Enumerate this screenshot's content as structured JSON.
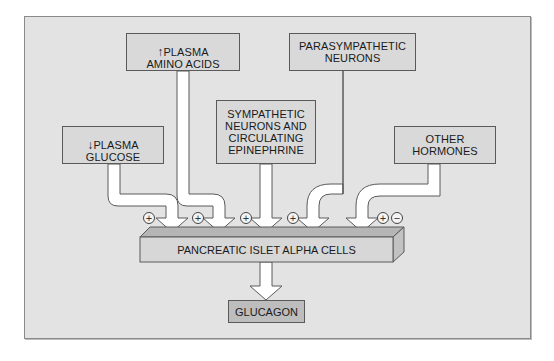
{
  "diagram": {
    "colors": {
      "frame_fill": "#e3e3e3",
      "box_fill": "#d9d9d9",
      "glucagon_fill": "#bdbdbd",
      "bar_top": "#b5b5b5",
      "bar_front": "#d7d7d7",
      "bar_side": "#c2c2c2",
      "arrow_fill": "#ffffff",
      "outline": "#5a5a5a"
    },
    "inputs": [
      {
        "id": "plasma-glucose",
        "arrow": "↓",
        "label": "PLASMA\nGLUCOSE",
        "effect": "+"
      },
      {
        "id": "plasma-amino-acids",
        "arrow": "↑",
        "label": "PLASMA\nAMINO ACIDS",
        "effect": "+"
      },
      {
        "id": "sympathetic",
        "arrow": "",
        "label": "SYMPATHETIC\nNEURONS AND\nCIRCULATING\nEPINEPHRINE",
        "effect": "+"
      },
      {
        "id": "parasympathetic",
        "arrow": "",
        "label": "PARASYMPATHETIC\nNEURONS",
        "effect": "+"
      },
      {
        "id": "other-hormones",
        "arrow": "",
        "label": "OTHER\nHORMONES",
        "effect": "+/−"
      }
    ],
    "signs": {
      "plus": "+",
      "minus": "−"
    },
    "target": {
      "label": "PANCREATIC ISLET ALPHA CELLS"
    },
    "output": {
      "label": "GLUCAGON"
    }
  }
}
